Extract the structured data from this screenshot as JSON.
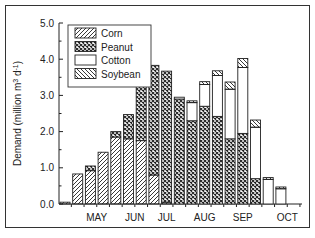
{
  "chart_data": {
    "type": "bar",
    "stacked": true,
    "title": "",
    "xlabel": "",
    "ylabel": "Demand (million m3 d-1)",
    "ylabel_parts": {
      "main": "Demand (million m",
      "sup1": "3",
      "mid": " d",
      "sup2": "-1",
      "end": ")"
    },
    "ylim": [
      0,
      5.0
    ],
    "yticks": [
      "0.0",
      "1.0",
      "2.0",
      "3.0",
      "4.0",
      "5.0"
    ],
    "xtick_labels": [
      {
        "label": "MAY",
        "bar_index": 2.5
      },
      {
        "label": "JUN",
        "bar_index": 5.5
      },
      {
        "label": "JUL",
        "bar_index": 8
      },
      {
        "label": "AUG",
        "bar_index": 11
      },
      {
        "label": "SEP",
        "bar_index": 14
      },
      {
        "label": "OCT",
        "bar_index": 17.5
      }
    ],
    "legend": {
      "position": "upper-left",
      "entries": [
        "Corn",
        "Peanut",
        "Cotton",
        "Soybean"
      ]
    },
    "categories": [
      "1",
      "2",
      "3",
      "4",
      "5",
      "6",
      "7",
      "8",
      "9",
      "10",
      "11",
      "12",
      "13",
      "14",
      "15",
      "16",
      "17",
      "18",
      "19"
    ],
    "series": [
      {
        "name": "Corn",
        "pattern": "diag-right",
        "values": [
          0.05,
          0.83,
          0.92,
          1.43,
          1.85,
          1.8,
          1.75,
          0.8,
          0.05,
          0,
          0,
          0,
          0,
          0,
          0,
          0,
          0,
          0,
          0
        ]
      },
      {
        "name": "Peanut",
        "pattern": "crosshatch",
        "values": [
          0,
          0,
          0.13,
          0,
          0.15,
          0.67,
          1.58,
          3.03,
          3.62,
          2.9,
          2.3,
          2.7,
          2.42,
          1.8,
          1.95,
          0.7,
          0,
          0,
          0
        ]
      },
      {
        "name": "Cotton",
        "pattern": "blank",
        "values": [
          0,
          0,
          0,
          0,
          0,
          0,
          0,
          0,
          0,
          0.05,
          0.5,
          0.6,
          1.13,
          1.37,
          1.82,
          1.42,
          0.68,
          0.42,
          0
        ]
      },
      {
        "name": "Soybean",
        "pattern": "diag-left",
        "values": [
          0,
          0,
          0,
          0,
          0,
          0,
          0,
          0,
          0,
          0,
          0.05,
          0.08,
          0.13,
          0.2,
          0.25,
          0.2,
          0.05,
          0.05,
          0
        ]
      }
    ],
    "grid": false
  }
}
